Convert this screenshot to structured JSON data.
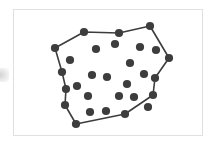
{
  "figure": {
    "title": "",
    "background_color": "#ffffff",
    "frame": {
      "border_color": "#e0e0e0",
      "x": 13,
      "y": 9,
      "width": 190,
      "height": 127
    },
    "artifact": {
      "description": "faint gray smudge at left margin",
      "color": "#c9c9c9"
    }
  },
  "chart_data": {
    "type": "scatter",
    "title": "",
    "subtitle": "",
    "xlabel": "",
    "ylabel": "",
    "xlim": [
      13,
      203
    ],
    "ylim": [
      9,
      136
    ],
    "grid": false,
    "legend": null,
    "annotations": [],
    "style": {
      "point_color": "#3d3d3d",
      "point_radius": 4.1,
      "hull_line_color": "#3d3d3d",
      "hull_line_width": 1.6,
      "hull_fill": "none"
    },
    "counts": {
      "total_points": 29,
      "hull_vertices": 12,
      "interior_points": 17
    },
    "hull_vertices": [
      {
        "id": "h1",
        "x": 84,
        "y": 32
      },
      {
        "id": "h2",
        "x": 119,
        "y": 33
      },
      {
        "id": "h3",
        "x": 150,
        "y": 26
      },
      {
        "id": "h4",
        "x": 169,
        "y": 58
      },
      {
        "id": "h5",
        "x": 155,
        "y": 78
      },
      {
        "id": "h6",
        "x": 153,
        "y": 95
      },
      {
        "id": "h7",
        "x": 125,
        "y": 114
      },
      {
        "id": "h8",
        "x": 76,
        "y": 124
      },
      {
        "id": "h9",
        "x": 65,
        "y": 105
      },
      {
        "id": "h10",
        "x": 66,
        "y": 89
      },
      {
        "id": "h11",
        "x": 62,
        "y": 72
      },
      {
        "id": "h12",
        "x": 55,
        "y": 48
      }
    ],
    "interior_points": [
      {
        "id": "p1",
        "x": 70,
        "y": 60
      },
      {
        "id": "p2",
        "x": 96,
        "y": 49
      },
      {
        "id": "p3",
        "x": 115,
        "y": 44
      },
      {
        "id": "p4",
        "x": 140,
        "y": 47
      },
      {
        "id": "p5",
        "x": 156,
        "y": 50
      },
      {
        "id": "p6",
        "x": 130,
        "y": 63
      },
      {
        "id": "p7",
        "x": 92,
        "y": 75
      },
      {
        "id": "p8",
        "x": 107,
        "y": 77
      },
      {
        "id": "p9",
        "x": 127,
        "y": 84
      },
      {
        "id": "p10",
        "x": 144,
        "y": 74
      },
      {
        "id": "p11",
        "x": 119,
        "y": 96
      },
      {
        "id": "p12",
        "x": 134,
        "y": 97
      },
      {
        "id": "p13",
        "x": 88,
        "y": 96
      },
      {
        "id": "p14",
        "x": 90,
        "y": 112
      },
      {
        "id": "p15",
        "x": 106,
        "y": 111
      },
      {
        "id": "p16",
        "x": 77,
        "y": 86
      },
      {
        "id": "p17",
        "x": 148,
        "y": 107
      }
    ],
    "hull_edges": [
      [
        "h1",
        "h2"
      ],
      [
        "h2",
        "h3"
      ],
      [
        "h3",
        "h4"
      ],
      [
        "h4",
        "h5"
      ],
      [
        "h5",
        "h6"
      ],
      [
        "h6",
        "h7"
      ],
      [
        "h7",
        "h8"
      ],
      [
        "h8",
        "h9"
      ],
      [
        "h9",
        "h10"
      ],
      [
        "h10",
        "h11"
      ],
      [
        "h11",
        "h12"
      ],
      [
        "h12",
        "h1"
      ]
    ]
  }
}
